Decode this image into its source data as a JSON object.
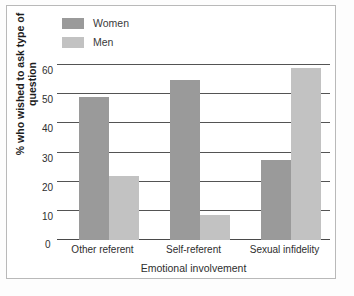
{
  "chart_data": {
    "type": "bar",
    "title": "",
    "xlabel": "Emotional involvement",
    "ylabel": "% who wished to ask type of question",
    "categories": [
      "Other referent",
      "Self-referent",
      "Sexual infidelity"
    ],
    "series": [
      {
        "name": "Women",
        "color": "#9a9a9a",
        "values": [
          49,
          55,
          27.5
        ]
      },
      {
        "name": "Men",
        "color": "#c2c2c2",
        "values": [
          22,
          8.5,
          59
        ]
      }
    ],
    "ylim": [
      0,
      60
    ],
    "yticks": [
      0,
      10,
      20,
      30,
      40,
      50,
      60
    ],
    "ytick_labels": [
      "0",
      "10",
      "20",
      "30",
      "40",
      "50",
      "60"
    ],
    "grid": true,
    "legend_position": "top-left",
    "legend_entries": [
      "Women",
      "Men"
    ]
  },
  "colors": {
    "women": "#9a9a9a",
    "men": "#c2c2c2",
    "gridline": "#545454",
    "frame": "#b9b9b9",
    "background": "#ffffff"
  }
}
